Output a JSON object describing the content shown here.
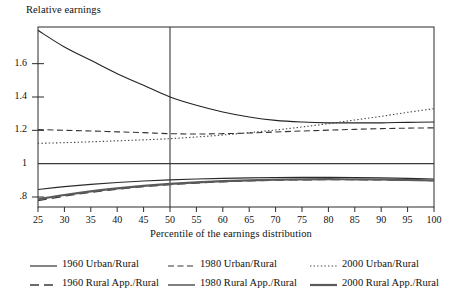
{
  "chart_data": {
    "type": "line",
    "title": "",
    "ylabel": "Relative earnings",
    "xlabel": "Percentile of the earnings distribution",
    "xlim": [
      25,
      100
    ],
    "ylim": [
      0.74,
      1.82
    ],
    "xticks": [
      25,
      30,
      35,
      40,
      45,
      50,
      55,
      60,
      65,
      70,
      75,
      80,
      85,
      90,
      95,
      100
    ],
    "yticks": [
      0.8,
      1,
      1.2,
      1.4,
      1.6
    ],
    "ytick_labels": [
      ".8",
      "1",
      "1.2",
      "1.4",
      "1.6"
    ],
    "xtick_labels": [
      "25",
      "30",
      "35",
      "40",
      "45",
      "50",
      "55",
      "60",
      "65",
      "70",
      "75",
      "80",
      "85",
      "90",
      "95",
      "100"
    ],
    "grid": false,
    "reference_lines": [
      {
        "name": "unity-line",
        "orientation": "horizontal",
        "value": 1
      },
      {
        "name": "median-line",
        "orientation": "vertical",
        "value": 50
      }
    ],
    "x": [
      25,
      30,
      35,
      40,
      45,
      50,
      55,
      60,
      65,
      70,
      75,
      80,
      85,
      90,
      95,
      100
    ],
    "series": [
      {
        "name": "1960 Urban/Rural",
        "style": "solid",
        "color": "#222222",
        "width": 1.1,
        "values": [
          1.8,
          1.7,
          1.62,
          1.54,
          1.47,
          1.4,
          1.35,
          1.31,
          1.28,
          1.26,
          1.25,
          1.245,
          1.245,
          1.245,
          1.248,
          1.25
        ]
      },
      {
        "name": "1980 Urban/Rural",
        "style": "dashed",
        "color": "#333333",
        "width": 1.1,
        "values": [
          1.205,
          1.2,
          1.196,
          1.191,
          1.186,
          1.18,
          1.178,
          1.18,
          1.184,
          1.19,
          1.196,
          1.201,
          1.206,
          1.21,
          1.213,
          1.215
        ]
      },
      {
        "name": "2000 Urban/Rural",
        "style": "dotted",
        "color": "#444444",
        "width": 1.1,
        "values": [
          1.122,
          1.126,
          1.131,
          1.137,
          1.143,
          1.15,
          1.16,
          1.172,
          1.186,
          1.202,
          1.22,
          1.24,
          1.262,
          1.284,
          1.308,
          1.33
        ]
      },
      {
        "name": "1960 Rural App./Rural",
        "style": "longdash",
        "color": "#3a3a3a",
        "width": 1.3,
        "values": [
          0.778,
          0.805,
          0.828,
          0.847,
          0.862,
          0.874,
          0.884,
          0.891,
          0.897,
          0.901,
          0.903,
          0.904,
          0.904,
          0.903,
          0.901,
          0.898
        ]
      },
      {
        "name": "1980 Rural App./Rural",
        "style": "solid",
        "color": "#2a2a2a",
        "width": 1.2,
        "values": [
          0.845,
          0.862,
          0.876,
          0.887,
          0.896,
          0.903,
          0.908,
          0.912,
          0.915,
          0.917,
          0.918,
          0.918,
          0.917,
          0.915,
          0.912,
          0.908
        ]
      },
      {
        "name": "2000 Rural App./Rural",
        "style": "thick-solid",
        "color": "#5a5a5a",
        "width": 2.2,
        "values": [
          0.786,
          0.812,
          0.834,
          0.852,
          0.867,
          0.879,
          0.888,
          0.895,
          0.9,
          0.904,
          0.906,
          0.907,
          0.906,
          0.905,
          0.902,
          0.899
        ]
      }
    ],
    "legend": {
      "position": "below",
      "columns": 3,
      "rows": 2,
      "entries": [
        {
          "label": "1960 Urban/Rural",
          "style": "solid"
        },
        {
          "label": "1980 Urban/Rural",
          "style": "dashed"
        },
        {
          "label": "2000 Urban/Rural",
          "style": "dotted"
        },
        {
          "label": "1960 Rural App./Rural",
          "style": "longdash"
        },
        {
          "label": "1980 Rural App./Rural",
          "style": "solid"
        },
        {
          "label": "2000 Rural App./Rural",
          "style": "thick-solid"
        }
      ]
    }
  }
}
